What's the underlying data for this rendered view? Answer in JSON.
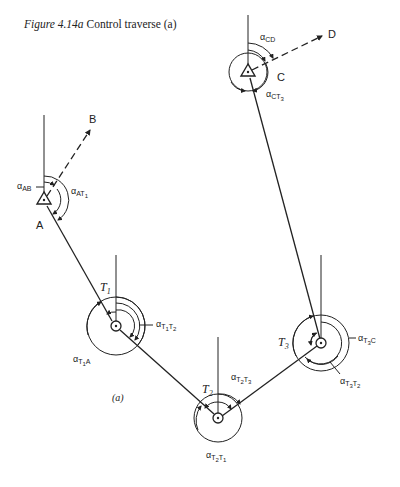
{
  "caption": {
    "figure": "Figure 4.14a",
    "title": "Control traverse (a)"
  },
  "sub_label": "(a)",
  "stations": {
    "A": {
      "label": "A",
      "type": "control"
    },
    "B": {
      "label": "B",
      "type": "reference"
    },
    "C": {
      "label": "C",
      "type": "control"
    },
    "D": {
      "label": "D",
      "type": "reference"
    },
    "T1": {
      "label": "T",
      "sub": "1",
      "type": "traverse"
    },
    "T2": {
      "label": "T",
      "sub": "2",
      "type": "traverse"
    },
    "T3": {
      "label": "T",
      "sub": "3",
      "type": "traverse"
    }
  },
  "angles": {
    "AB": {
      "alpha": "α",
      "sub": "AB"
    },
    "AT1": {
      "alpha": "α",
      "sub": "AT",
      "subsub": "1"
    },
    "CD": {
      "alpha": "α",
      "sub": "CD"
    },
    "CT3": {
      "alpha": "α",
      "sub": "CT",
      "subsub": "3"
    },
    "T1T2": {
      "alpha": "α",
      "sub": "T",
      "s1": "1",
      "sub2": "T",
      "s2": "2"
    },
    "T1A": {
      "alpha": "α",
      "sub": "T",
      "s1": "1",
      "sub2": "A"
    },
    "T2T3": {
      "alpha": "α",
      "sub": "T",
      "s1": "2",
      "sub2": "T",
      "s2": "3"
    },
    "T2T1": {
      "alpha": "α",
      "sub": "T",
      "s1": "2",
      "sub2": "T",
      "s2": "1"
    },
    "T3C": {
      "alpha": "α",
      "sub": "T",
      "s1": "3",
      "sub2": "C"
    },
    "T3T2": {
      "alpha": "α",
      "sub": "T",
      "s1": "3",
      "sub2": "T",
      "s2": "2"
    }
  },
  "colors": {
    "ink": "#222222",
    "background": "#ffffff"
  }
}
